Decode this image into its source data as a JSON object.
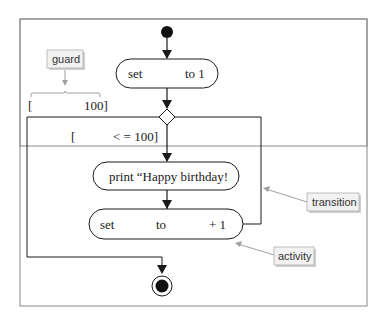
{
  "diagram": {
    "type": "uml-activity",
    "nodes": {
      "init_label": "set",
      "init_label2": "to 1",
      "print_label": "print “Happy birthday!",
      "incr_set": "set",
      "incr_to": "to",
      "incr_plus": "+ 1"
    },
    "guards": {
      "exit_open": "[",
      "exit_close": "100]",
      "loop_open": "[",
      "loop_close": "< = 100]"
    },
    "callouts": {
      "guard": "guard",
      "transition": "transition",
      "activity": "activity"
    },
    "colors": {
      "line": "#1a1a1a",
      "callout_line": "#a0a0a0",
      "callout_bg": "#f2f2f2",
      "frame": "#888888"
    }
  }
}
